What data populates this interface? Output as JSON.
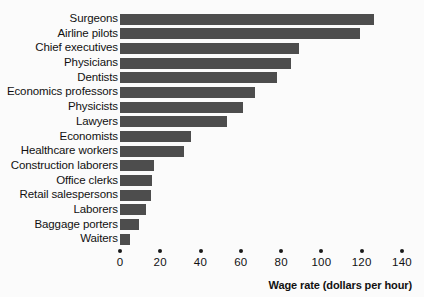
{
  "chart_data": {
    "type": "bar",
    "orientation": "horizontal",
    "title": "",
    "xlabel": "Wage rate (dollars per hour)",
    "ylabel": "",
    "xlim": [
      0,
      140
    ],
    "xticks": [
      0,
      20,
      40,
      60,
      80,
      100,
      120,
      140
    ],
    "grid": false,
    "legend": false,
    "bar_color": "#4d4d4d",
    "background_color": "#fbfbfb",
    "categories": [
      "Surgeons",
      "Airline pilots",
      "Chief executives",
      "Physicians",
      "Dentists",
      "Economics professors",
      "Physicists",
      "Lawyers",
      "Economists",
      "Healthcare workers",
      "Construction laborers",
      "Office clerks",
      "Retail salespersons",
      "Laborers",
      "Baggage porters",
      "Waiters"
    ],
    "values": [
      126,
      119,
      89,
      85,
      78,
      67,
      61,
      53,
      35,
      32,
      17,
      16,
      15.5,
      13,
      9.5,
      5
    ]
  }
}
